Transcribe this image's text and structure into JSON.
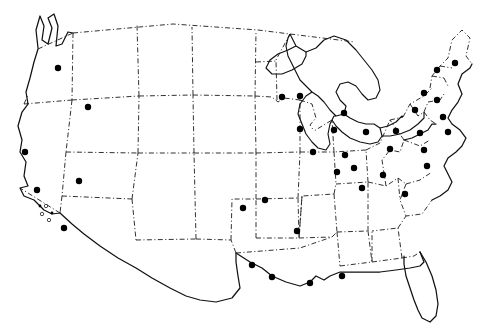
{
  "figure": {
    "kind": "dot-distribution-map",
    "region": "contiguous-united-states",
    "title": "",
    "caption": "",
    "background_color": "#ffffff",
    "line_color": "#111111",
    "border_color": "#1a1a1a",
    "marker_color": "#000000",
    "border_style": "dash-dot",
    "marker_legend": [
      {
        "key": "major",
        "label": "",
        "shape": "filled-circle",
        "radius": 3.2
      },
      {
        "key": "minor",
        "label": "",
        "shape": "filled-circle",
        "radius": 1.4
      },
      {
        "key": "open",
        "label": "",
        "shape": "open-circle",
        "radius": 1.7
      }
    ]
  },
  "chart_data": {
    "type": "scatter",
    "title": "",
    "xlabel": "",
    "ylabel": "",
    "grid": false,
    "legend": "none",
    "xlim": [
      0,
      495
    ],
    "ylim": [
      0,
      334
    ],
    "points": [
      {
        "x": 58,
        "y": 68,
        "size": "major"
      },
      {
        "x": 88,
        "y": 107,
        "size": "major"
      },
      {
        "x": 25,
        "y": 152,
        "size": "major"
      },
      {
        "x": 37,
        "y": 190,
        "size": "major"
      },
      {
        "x": 40,
        "y": 206,
        "size": "minor"
      },
      {
        "x": 46,
        "y": 206,
        "size": "open"
      },
      {
        "x": 42,
        "y": 214,
        "size": "open"
      },
      {
        "x": 52,
        "y": 213,
        "size": "minor"
      },
      {
        "x": 49,
        "y": 220,
        "size": "open"
      },
      {
        "x": 64,
        "y": 228,
        "size": "major"
      },
      {
        "x": 79,
        "y": 181,
        "size": "major"
      },
      {
        "x": 243,
        "y": 208,
        "size": "major"
      },
      {
        "x": 265,
        "y": 200,
        "size": "major"
      },
      {
        "x": 252,
        "y": 265,
        "size": "major"
      },
      {
        "x": 272,
        "y": 277,
        "size": "major"
      },
      {
        "x": 282,
        "y": 97,
        "size": "major"
      },
      {
        "x": 300,
        "y": 96,
        "size": "major"
      },
      {
        "x": 300,
        "y": 129,
        "size": "major"
      },
      {
        "x": 313,
        "y": 152,
        "size": "major"
      },
      {
        "x": 334,
        "y": 130,
        "size": "major"
      },
      {
        "x": 337,
        "y": 172,
        "size": "major"
      },
      {
        "x": 344,
        "y": 113,
        "size": "major"
      },
      {
        "x": 345,
        "y": 155,
        "size": "major"
      },
      {
        "x": 354,
        "y": 168,
        "size": "major"
      },
      {
        "x": 362,
        "y": 188,
        "size": "major"
      },
      {
        "x": 383,
        "y": 175,
        "size": "major"
      },
      {
        "x": 366,
        "y": 132,
        "size": "major"
      },
      {
        "x": 396,
        "y": 131,
        "size": "major"
      },
      {
        "x": 390,
        "y": 149,
        "size": "major"
      },
      {
        "x": 405,
        "y": 194,
        "size": "major"
      },
      {
        "x": 420,
        "y": 133,
        "size": "major"
      },
      {
        "x": 424,
        "y": 150,
        "size": "major"
      },
      {
        "x": 427,
        "y": 166,
        "size": "major"
      },
      {
        "x": 415,
        "y": 110,
        "size": "major"
      },
      {
        "x": 424,
        "y": 93,
        "size": "major"
      },
      {
        "x": 437,
        "y": 100,
        "size": "major"
      },
      {
        "x": 443,
        "y": 117,
        "size": "major"
      },
      {
        "x": 448,
        "y": 132,
        "size": "major"
      },
      {
        "x": 455,
        "y": 63,
        "size": "major"
      },
      {
        "x": 437,
        "y": 70,
        "size": "major"
      },
      {
        "x": 297,
        "y": 231,
        "size": "major"
      },
      {
        "x": 342,
        "y": 276,
        "size": "major"
      },
      {
        "x": 310,
        "y": 283,
        "size": "major"
      }
    ]
  }
}
